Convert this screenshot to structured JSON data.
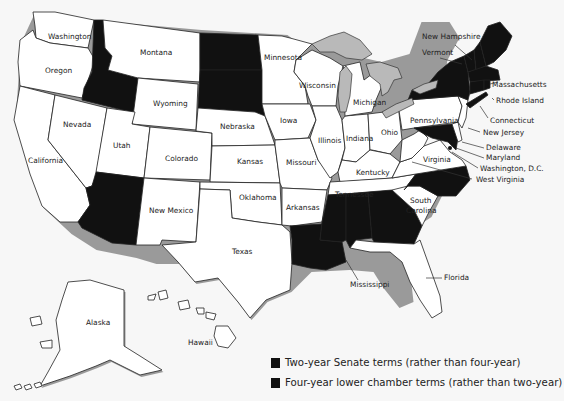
{
  "map": {
    "type": "us-state-choropleth",
    "fill_colors": {
      "highlighted": "#111111",
      "default": "#ffffff",
      "lakes": "#b9b9b9",
      "background": "#f7f7f7"
    },
    "states": [
      {
        "name": "Washington",
        "highlighted": false
      },
      {
        "name": "Oregon",
        "highlighted": false
      },
      {
        "name": "California",
        "highlighted": false
      },
      {
        "name": "Nevada",
        "highlighted": false
      },
      {
        "name": "Idaho",
        "highlighted": true,
        "label_visible": false
      },
      {
        "name": "Montana",
        "highlighted": false
      },
      {
        "name": "Wyoming",
        "highlighted": false
      },
      {
        "name": "Utah",
        "highlighted": false
      },
      {
        "name": "Arizona",
        "highlighted": true,
        "label_visible": false
      },
      {
        "name": "Colorado",
        "highlighted": false
      },
      {
        "name": "New Mexico",
        "highlighted": false
      },
      {
        "name": "North Dakota",
        "highlighted": true,
        "label_visible": false
      },
      {
        "name": "South Dakota",
        "highlighted": true,
        "label_visible": false
      },
      {
        "name": "Nebraska",
        "highlighted": false
      },
      {
        "name": "Kansas",
        "highlighted": false
      },
      {
        "name": "Oklahoma",
        "highlighted": false
      },
      {
        "name": "Texas",
        "highlighted": false
      },
      {
        "name": "Minnesota",
        "highlighted": false
      },
      {
        "name": "Iowa",
        "highlighted": false
      },
      {
        "name": "Missouri",
        "highlighted": false
      },
      {
        "name": "Arkansas",
        "highlighted": false
      },
      {
        "name": "Louisiana",
        "highlighted": true,
        "label_visible": false
      },
      {
        "name": "Wisconsin",
        "highlighted": false
      },
      {
        "name": "Illinois",
        "highlighted": false
      },
      {
        "name": "Michigan",
        "highlighted": false
      },
      {
        "name": "Indiana",
        "highlighted": false
      },
      {
        "name": "Ohio",
        "highlighted": false
      },
      {
        "name": "Kentucky",
        "highlighted": false
      },
      {
        "name": "Tennessee",
        "highlighted": false
      },
      {
        "name": "Mississippi",
        "highlighted": true
      },
      {
        "name": "Alabama",
        "highlighted": true,
        "label_visible": false
      },
      {
        "name": "Georgia",
        "highlighted": true,
        "label_visible": false
      },
      {
        "name": "Florida",
        "highlighted": false
      },
      {
        "name": "South Carolina",
        "highlighted": false
      },
      {
        "name": "North Carolina",
        "highlighted": true,
        "label_visible": false
      },
      {
        "name": "Virginia",
        "highlighted": false
      },
      {
        "name": "West Virginia",
        "highlighted": false
      },
      {
        "name": "Pennsylvania",
        "highlighted": false
      },
      {
        "name": "New York",
        "highlighted": true,
        "label_visible": false
      },
      {
        "name": "New Jersey",
        "highlighted": false
      },
      {
        "name": "Delaware",
        "highlighted": false
      },
      {
        "name": "Maryland",
        "highlighted": true
      },
      {
        "name": "Washington, D.C.",
        "highlighted": false
      },
      {
        "name": "Connecticut",
        "highlighted": true
      },
      {
        "name": "Rhode Island",
        "highlighted": true
      },
      {
        "name": "Massachusetts",
        "highlighted": true
      },
      {
        "name": "Vermont",
        "highlighted": true
      },
      {
        "name": "New Hampshire",
        "highlighted": true
      },
      {
        "name": "Maine",
        "highlighted": true,
        "label_visible": false
      },
      {
        "name": "Alaska",
        "highlighted": false
      },
      {
        "name": "Hawaii",
        "highlighted": false
      }
    ],
    "labels": {
      "washington": "Washington",
      "oregon": "Oregon",
      "california": "California",
      "nevada": "Nevada",
      "montana": "Montana",
      "wyoming": "Wyoming",
      "utah": "Utah",
      "colorado": "Colorado",
      "new_mexico": "New Mexico",
      "nebraska": "Nebraska",
      "kansas": "Kansas",
      "oklahoma": "Oklahoma",
      "texas": "Texas",
      "minnesota": "Minnesota",
      "iowa": "Iowa",
      "missouri": "Missouri",
      "arkansas": "Arkansas",
      "wisconsin": "Wisconsin",
      "illinois": "Illinois",
      "michigan": "Michigan",
      "indiana": "Indiana",
      "ohio": "Ohio",
      "kentucky": "Kentucky",
      "tennessee": "Tennessee",
      "mississippi": "Mississippi",
      "florida": "Florida",
      "south_carolina_1": "South",
      "south_carolina_2": "Carolina",
      "virginia": "Virginia",
      "west_virginia": "West Virginia",
      "pennsylvania": "Pennsylvania",
      "new_jersey": "New Jersey",
      "delaware": "Delaware",
      "maryland": "Maryland",
      "washington_dc": "Washington, D.C.",
      "connecticut": "Connecticut",
      "rhode_island": "Rhode Island",
      "massachusetts": "Massachusetts",
      "vermont": "Vermont",
      "new_hampshire": "New Hampshire",
      "alaska": "Alaska",
      "hawaii": "Hawaii"
    }
  },
  "legend": {
    "items": [
      {
        "label": "Two-year Senate terms (rather than four-year)",
        "color": "#111111"
      },
      {
        "label": "Four-year lower chamber terms (rather than two-year)",
        "color": "#111111"
      }
    ]
  }
}
